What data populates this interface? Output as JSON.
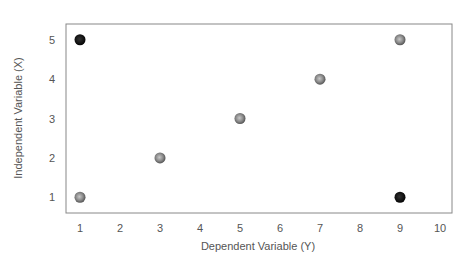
{
  "chart_data": {
    "type": "scatter",
    "title": "",
    "xlabel": "Dependent Variable (Y)",
    "ylabel": "Independent Variable (X)",
    "xlim": [
      0.65,
      10.3
    ],
    "ylim": [
      0.6,
      5.4
    ],
    "xticks": [
      1,
      2,
      3,
      4,
      5,
      6,
      7,
      8,
      9,
      10
    ],
    "yticks": [
      1,
      2,
      3,
      4,
      5
    ],
    "grid": false,
    "legend": null,
    "colors": {
      "highlight": "#000000",
      "normal": "#808080",
      "frame": "#888888"
    },
    "points": [
      {
        "x": 1,
        "y": 5,
        "style": "highlight"
      },
      {
        "x": 1,
        "y": 1,
        "style": "normal"
      },
      {
        "x": 3,
        "y": 2,
        "style": "normal"
      },
      {
        "x": 5,
        "y": 3,
        "style": "normal"
      },
      {
        "x": 7,
        "y": 4,
        "style": "normal"
      },
      {
        "x": 9,
        "y": 5,
        "style": "normal"
      },
      {
        "x": 9,
        "y": 1,
        "style": "highlight"
      }
    ]
  }
}
